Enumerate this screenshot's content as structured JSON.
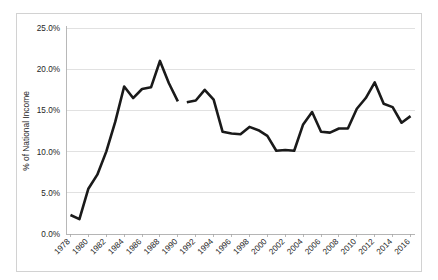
{
  "chart_data": {
    "type": "line",
    "title": "",
    "subtitle": "",
    "xlabel": "",
    "ylabel": "% of National Income",
    "ylim": [
      0,
      25
    ],
    "xlim": [
      1978,
      2017
    ],
    "grid": true,
    "legend": false,
    "legend_position": "none",
    "y_ticks": [
      0,
      5,
      10,
      15,
      20,
      25
    ],
    "y_tick_labels": [
      "0.0%",
      "5.0%",
      "10.0%",
      "15.0%",
      "20.0%",
      "25.0%"
    ],
    "x_tick_labels": [
      "1978",
      "1980",
      "1982",
      "1984",
      "1986",
      "1988",
      "1990",
      "1992",
      "1994",
      "1996",
      "1998",
      "2000",
      "2002",
      "2004",
      "2006",
      "2008",
      "2010",
      "2012",
      "2014",
      "2016"
    ],
    "line_color": "#1a1a1a",
    "grid_color": "#d9d9d9",
    "series": [
      {
        "name": "% of National Income",
        "x": [
          1978,
          1979,
          1980,
          1981,
          1982,
          1983,
          1984,
          1985,
          1986,
          1987,
          1988,
          1989,
          1990
        ],
        "values": [
          2.3,
          1.8,
          5.5,
          7.2,
          10.0,
          13.6,
          17.9,
          16.5,
          17.6,
          17.8,
          21.0,
          18.3,
          16.1
        ]
      },
      {
        "name": "% of National Income (cont.)",
        "x": [
          1991,
          1992,
          1993,
          1994,
          1995,
          1996,
          1997,
          1998,
          1999,
          2000,
          2001,
          2002,
          2003,
          2004,
          2005,
          2006,
          2007,
          2008,
          2009,
          2010,
          2011,
          2012,
          2013,
          2014,
          2015,
          2016
        ],
        "values": [
          16.0,
          16.2,
          17.5,
          16.3,
          12.4,
          12.2,
          12.1,
          13.0,
          12.6,
          11.9,
          10.1,
          10.2,
          10.1,
          13.3,
          14.8,
          12.4,
          12.3,
          12.8,
          12.8,
          15.2,
          16.5,
          18.4,
          15.8,
          15.4,
          13.5,
          14.3
        ]
      }
    ]
  }
}
